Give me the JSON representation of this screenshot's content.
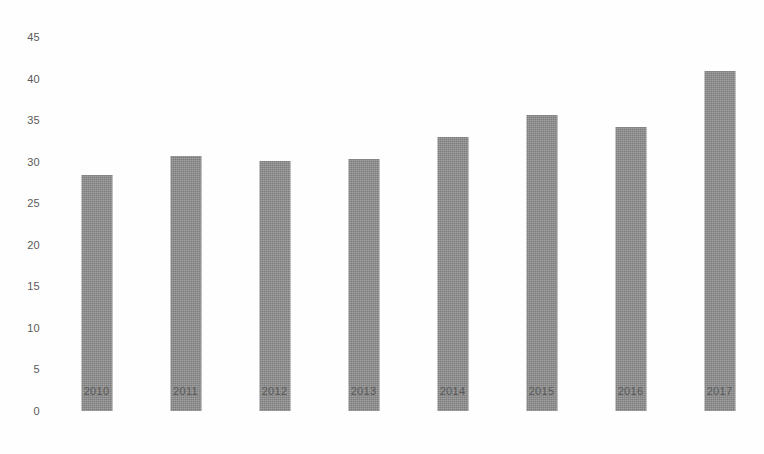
{
  "chart_data": {
    "type": "bar",
    "title": "",
    "subtitle": "",
    "xlabel": "",
    "ylabel": "",
    "categories": [
      "2010",
      "2011",
      "2012",
      "2013",
      "2014",
      "2015",
      "2016",
      "2017"
    ],
    "values": [
      28.4,
      30.7,
      30.1,
      30.3,
      33.0,
      35.6,
      34.2,
      40.9
    ],
    "ylim": [
      0,
      45
    ],
    "ytick_labels": [
      "45",
      "40",
      "35",
      "30",
      "25",
      "20",
      "15",
      "10",
      "5",
      "0"
    ],
    "ytick_values": [
      45,
      40,
      35,
      30,
      25,
      20,
      15,
      10,
      5,
      0
    ],
    "ytick_step": 5,
    "grid": false,
    "legend": false,
    "legend_position": "none",
    "series": [
      {
        "name": "",
        "values": [
          28.4,
          30.7,
          30.1,
          30.3,
          33.0,
          35.6,
          34.2,
          40.9
        ]
      }
    ],
    "colors": {
      "bar": "#8a8a8a",
      "tick_label": "#5a5a5a",
      "background": "#fefefe"
    }
  }
}
